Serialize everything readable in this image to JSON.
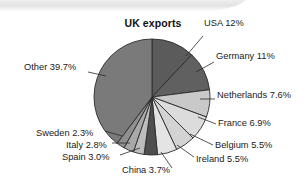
{
  "chart_data": {
    "type": "pie",
    "title": "UK exports",
    "xlabel": "",
    "ylabel": "",
    "legend_position": "none",
    "grid": false,
    "unit": "%",
    "start_angle_deg": 0,
    "direction": "clockwise",
    "categories": [
      "USA",
      "Germany",
      "Netherlands",
      "France",
      "Belgium",
      "Ireland",
      "China",
      "Spain",
      "Italy",
      "Sweden",
      "Other"
    ],
    "values": [
      12,
      11,
      7.6,
      6.9,
      5.5,
      5.5,
      3.7,
      3.0,
      2.8,
      2.3,
      39.7
    ],
    "labels": [
      "USA 12%",
      "Germany 11%",
      "Netherlands 7.6%",
      "France 6.9%",
      "Belgium 5.5%",
      "Ireland 5.5%",
      "China 3.7%",
      "Spain 3.0%",
      "Italy 2.8%",
      "Sweden 2.3%",
      "Other 39.7%"
    ],
    "colors": [
      "#5b5b5b",
      "#606060",
      "#c9c9c9",
      "#dcdcdc",
      "#d3d3d3",
      "#e4e4e4",
      "#4e4e4e",
      "#bdbdbd",
      "#a8a8a8",
      "#8f8f8f",
      "#7a7a7a"
    ],
    "slice_stroke": "#2b2b2b",
    "geometry": {
      "cx": 152,
      "cy": 97,
      "r": 58
    }
  },
  "labels_layout": [
    {
      "key": "usa",
      "text": "USA 12%",
      "x": 204,
      "y": 24,
      "lx1": 203,
      "ly1": 36,
      "lx2": 186,
      "ly2": 56
    },
    {
      "key": "germany",
      "text": "Germany 11%",
      "x": 216,
      "y": 57,
      "lx1": 214,
      "ly1": 62,
      "lx2": 196,
      "ly2": 72
    },
    {
      "key": "netherlands",
      "text": "Netherlands 7.6%",
      "x": 217,
      "y": 96,
      "lx1": 215,
      "ly1": 99,
      "lx2": 200,
      "ly2": 99
    },
    {
      "key": "france",
      "text": "France 6.9%",
      "x": 218,
      "y": 124,
      "lx1": 216,
      "ly1": 124,
      "lx2": 198,
      "ly2": 117
    },
    {
      "key": "belgium",
      "text": "Belgium 5.5%",
      "x": 215,
      "y": 146,
      "lx1": 213,
      "ly1": 145,
      "lx2": 190,
      "ly2": 134
    },
    {
      "key": "ireland",
      "text": "Ireland 5.5%",
      "x": 196,
      "y": 160,
      "lx1": 194,
      "ly1": 157,
      "lx2": 177,
      "ly2": 145
    },
    {
      "key": "china",
      "text": "China 3.7%",
      "x": 122,
      "y": 171,
      "lx1": 172,
      "ly1": 168,
      "lx2": 161,
      "ly2": 152
    },
    {
      "key": "spain",
      "text": "Spain 3.0%",
      "x": 62,
      "y": 158,
      "lx1": 120,
      "ly1": 155,
      "lx2": 140,
      "ly2": 148
    },
    {
      "key": "italy",
      "text": "Italy 2.8%",
      "x": 66,
      "y": 146,
      "lx1": 112,
      "ly1": 143,
      "lx2": 130,
      "ly2": 143
    },
    {
      "key": "sweden",
      "text": "Sweden 2.3%",
      "x": 36,
      "y": 134,
      "lx1": 105,
      "ly1": 131,
      "lx2": 122,
      "ly2": 136
    },
    {
      "key": "other",
      "text": "Other 39.7%",
      "x": 24,
      "y": 68,
      "lx1": 88,
      "ly1": 72,
      "lx2": 106,
      "ly2": 76
    }
  ]
}
